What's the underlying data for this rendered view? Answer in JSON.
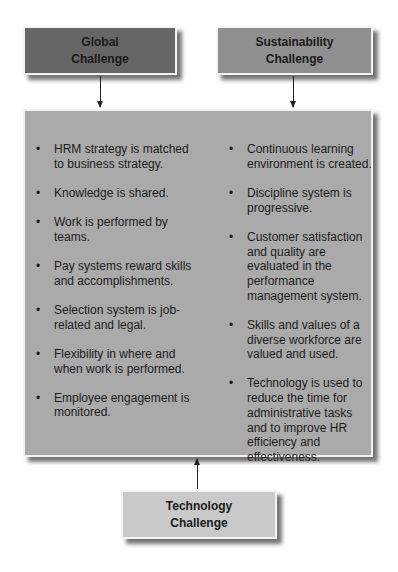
{
  "global_challenge": {
    "line1": "Global",
    "line2": "Challenge",
    "color": "#666666"
  },
  "sustainability_challenge": {
    "line1": "Sustainability",
    "line2": "Challenge",
    "color": "#8f8f8f"
  },
  "technology_challenge": {
    "line1": "Technology",
    "line2": "Challenge",
    "color": "#c9c9c9"
  },
  "main": {
    "color": "#aaaaaa",
    "left_items": [
      "HRM strategy is matched to business strategy.",
      "Knowledge is shared.",
      "Work is performed by teams.",
      "Pay systems reward skills and accomplishments.",
      "Selection system is job-related and legal.",
      "Flexibility in where and when work is performed.",
      "Employee engagement is monitored."
    ],
    "right_items": [
      "Continuous learning environment is created.",
      "Discipline system is progressive.",
      "Customer satisfaction and quality are evaluated in the performance management system.",
      "Skills and values of a diverse workforce are valued and used.",
      "Technology is used to reduce the time for administrative tasks and to improve HR efficiency and effectiveness."
    ]
  }
}
